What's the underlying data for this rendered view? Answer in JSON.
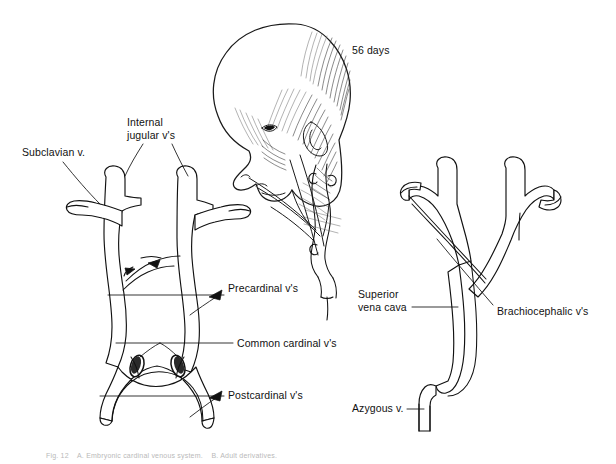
{
  "figure": {
    "stage_label": "56 days",
    "caption": "Fig. 12    A. Embryonic cardinal venous system.    B. Adult derivatives."
  },
  "left_diagram": {
    "name": "embryonic-cardinal-venous-system",
    "labels": [
      {
        "id": "subclavian",
        "text": "Subclavian v.",
        "x": 22,
        "y": 152
      },
      {
        "id": "internal-jugular",
        "text": "Internal\njugular v's",
        "x": 127,
        "y": 122
      },
      {
        "id": "precardinal",
        "text": "Precardinal v's",
        "x": 228,
        "y": 288
      },
      {
        "id": "common-cardinal",
        "text": "Common cardinal v's",
        "x": 237,
        "y": 339
      },
      {
        "id": "postcardinal",
        "text": "Postcardinal v's",
        "x": 228,
        "y": 389
      }
    ]
  },
  "right_diagram": {
    "name": "adult-derivative-venous-system",
    "labels": [
      {
        "id": "superior-vena-cava",
        "text": "Superior\nvena cava",
        "x": 358,
        "y": 288
      },
      {
        "id": "brachiocephalic",
        "text": "Brachiocephalic v's",
        "x": 497,
        "y": 311
      },
      {
        "id": "azygous",
        "text": "Azygous v.",
        "x": 352,
        "y": 402
      }
    ]
  },
  "embryo": {
    "name": "embryo-head-profile",
    "stage_text": "56 days",
    "stage_x": 352,
    "stage_y": 50
  },
  "colors": {
    "ink": "#111111",
    "background": "#ffffff",
    "hatching": "#2a2a2a",
    "caption": "#b9b9b9"
  }
}
